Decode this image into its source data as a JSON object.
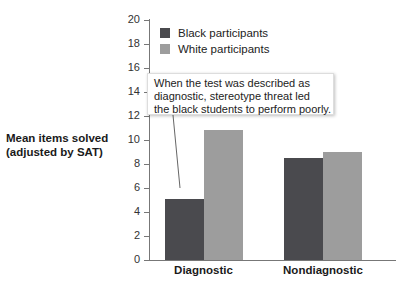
{
  "chart_data": {
    "type": "bar",
    "title": "",
    "xlabel": "",
    "ylabel": "Mean items solved (adjusted by SAT)",
    "ylabel_lines": [
      "Mean items solved",
      "(adjusted by SAT)"
    ],
    "ylim": [
      0,
      20
    ],
    "yticks": [
      0,
      2,
      4,
      6,
      8,
      10,
      12,
      14,
      16,
      18,
      20
    ],
    "categories": [
      "Diagnostic",
      "Nondiagnostic"
    ],
    "series": [
      {
        "name": "Black participants",
        "color": "#4a4a4e",
        "values": [
          5.1,
          8.5
        ]
      },
      {
        "name": "White participants",
        "color": "#9d9d9d",
        "values": [
          10.8,
          9.0
        ]
      }
    ],
    "legend_position": "top-left inside plot",
    "grid": false,
    "annotation": {
      "lines": [
        "When the test was described as",
        "diagnostic, stereotype threat led",
        "the black students to perform poorly."
      ],
      "points_to": "Diagnostic / Black participants"
    }
  }
}
